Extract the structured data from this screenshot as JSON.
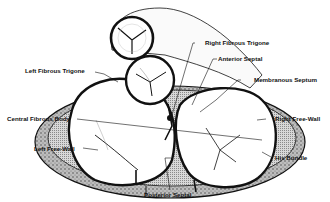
{
  "diagram": {
    "type": "anatomical cross-section",
    "colors": {
      "ink": "#111111",
      "hatch": "#9a9a9a",
      "background": "#ffffff"
    },
    "labels": {
      "right_fibrous_trigone": "Right Fibrous Trigone",
      "left_fibrous_trigone": "Left Fibrous Trigone",
      "anterior_septal": "Anterior Septal",
      "membranous_septum": "Membranous Septum",
      "central_fibrous_body": "Central Fibrous Body",
      "right_free_wall": "Right Free-Wall",
      "left_free_wall": "Left Free-Wall",
      "his_bundle": "His Bundle",
      "posterior_septal": "Posterior Septal"
    }
  }
}
